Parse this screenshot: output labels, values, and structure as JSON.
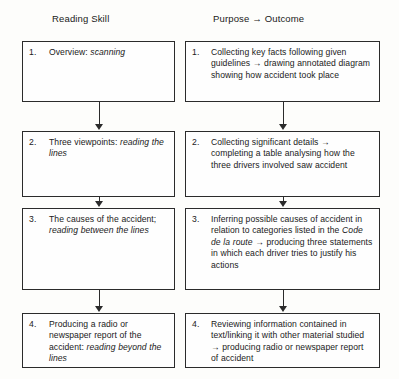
{
  "page": {
    "crop_remnant": "    ",
    "columns": {
      "left_header": "Reading Skill",
      "right_header": "Purpose → Outcome"
    }
  },
  "flow": {
    "left_column": [
      {
        "number": "1.",
        "text_parts": [
          {
            "text": "Overview: ",
            "italic": false
          },
          {
            "text": "scanning",
            "italic": true
          }
        ],
        "plain": "Overview: scanning"
      },
      {
        "number": "2.",
        "text_parts": [
          {
            "text": "Three viewpoints: ",
            "italic": false
          },
          {
            "text": "reading the lines",
            "italic": true
          }
        ],
        "plain": "Three viewpoints: reading the lines"
      },
      {
        "number": "3.",
        "text_parts": [
          {
            "text": "The causes of the accident; ",
            "italic": false
          },
          {
            "text": "reading between the lines",
            "italic": true
          }
        ],
        "plain": "The causes of the accident; reading between the lines"
      },
      {
        "number": "4.",
        "text_parts": [
          {
            "text": "Producing a radio or newspaper report of the accident: ",
            "italic": false
          },
          {
            "text": "reading beyond the lines",
            "italic": true
          }
        ],
        "plain": "Producing a radio or newspaper report of the accident: reading beyond the lines"
      }
    ],
    "right_column": [
      {
        "number": "1.",
        "text_parts": [
          {
            "text": "Collecting key facts following given guidelines → drawing annotated diagram showing how accident took place",
            "italic": false
          }
        ],
        "plain": "Collecting key facts following given guidelines → drawing annotated diagram showing how accident took place"
      },
      {
        "number": "2.",
        "text_parts": [
          {
            "text": "Collecting significant details → completing a table analysing how the three drivers involved saw accident",
            "italic": false
          }
        ],
        "plain": "Collecting significant details → completing a table analysing how the three drivers involved saw accident"
      },
      {
        "number": "3.",
        "text_parts": [
          {
            "text": "Inferring possible causes of accident in relation to categories listed in the ",
            "italic": false
          },
          {
            "text": "Code de la route",
            "italic": true
          },
          {
            "text": " → producing three statements in which each driver tries to justify his actions",
            "italic": false
          }
        ],
        "plain": "Inferring possible causes of accident in relation to categories listed in the Code de la route → producing three statements in which each driver tries to justify his actions"
      },
      {
        "number": "4.",
        "text_parts": [
          {
            "text": "Reviewing information contained in text/linking it with other material studied → producing radio or newspaper report of accident",
            "italic": false
          }
        ],
        "plain": "Reviewing information contained in text/linking it with other material studied → producing radio or newspaper report of accident"
      }
    ]
  },
  "style": {
    "line_color": "#2b2b2b",
    "background": "#fdfdfb",
    "text_color": "#1a1a1a"
  }
}
